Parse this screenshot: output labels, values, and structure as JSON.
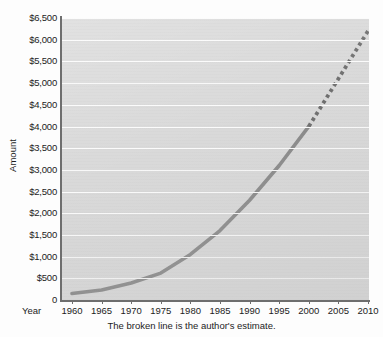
{
  "chart_data": {
    "type": "line",
    "title": "",
    "xlabel": "Year",
    "ylabel": "Amount",
    "xlim": [
      1960,
      2010
    ],
    "ylim": [
      0,
      6500
    ],
    "grid": true,
    "legend": "none",
    "x_tick_labels": [
      "1960",
      "1965",
      "1970",
      "1975",
      "1980",
      "1985",
      "1990",
      "1995",
      "2000",
      "2005",
      "2010"
    ],
    "y_tick_labels": [
      "0",
      "$500",
      "$1,000",
      "$1,500",
      "$2,000",
      "$2,500",
      "$3,000",
      "$3,500",
      "$4,000",
      "$4,500",
      "$5,000",
      "$5,500",
      "$6,000",
      "$6,500"
    ],
    "y_tick_values": [
      0,
      500,
      1000,
      1500,
      2000,
      2500,
      3000,
      3500,
      4000,
      4500,
      5000,
      5500,
      6000,
      6500
    ],
    "x": [
      1960,
      1965,
      1970,
      1975,
      1980,
      1985,
      1990,
      1995,
      2000,
      2005,
      2010
    ],
    "values": [
      150,
      230,
      390,
      620,
      1050,
      1600,
      2300,
      3100,
      4000,
      5100,
      6200
    ],
    "series": [
      {
        "name": "Amount (actual)",
        "style": "solid",
        "color": "#8a8a8a",
        "x": [
          1960,
          1965,
          1970,
          1975,
          1980,
          1985,
          1990,
          1995,
          2000
        ],
        "values": [
          150,
          230,
          390,
          620,
          1050,
          1600,
          2300,
          3100,
          4000
        ]
      },
      {
        "name": "Amount (author's estimate)",
        "style": "dotted",
        "color": "#6f6f6f",
        "x": [
          2000,
          2005,
          2010
        ],
        "values": [
          4000,
          5100,
          6200
        ]
      }
    ],
    "annotations": [
      "The broken line is the author's estimate."
    ],
    "caption": "The broken line is the author's estimate."
  },
  "axis": {
    "year_word": "Year",
    "amount_word": "Amount"
  },
  "colors": {
    "plot_background": "#d9d9d9",
    "gridline": "#fbfbfb",
    "axis": "#6e6e6e",
    "line_solid": "#8a8a8a",
    "line_dotted": "#6f6f6f",
    "text": "#1c1c1c",
    "page_background": "#fdfdfd"
  },
  "caption": {
    "text": "The broken line is the author's estimate."
  }
}
